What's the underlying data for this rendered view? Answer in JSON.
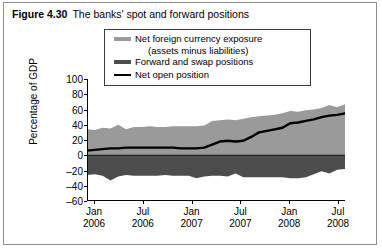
{
  "figure": {
    "number": "Figure 4.30",
    "caption": "The banks' spot and forward positions"
  },
  "colors": {
    "exposure_band": "#9a9a9a",
    "forward_swap": "#4d4d4d",
    "net_open_line": "#000000",
    "axis": "#000000",
    "frame": "#8d8d8d"
  },
  "chart_data": {
    "type": "area",
    "title": "The banks' spot and forward positions",
    "xlabel": "",
    "ylabel": "Percentage of GDP",
    "ylim": [
      -60,
      100
    ],
    "yticks": [
      100,
      80,
      60,
      40,
      20,
      0,
      -20,
      -40,
      -60
    ],
    "ytick_labels": [
      "100",
      "80",
      "60",
      "40",
      "20",
      "0",
      "–20",
      "–40",
      "–60"
    ],
    "grid": false,
    "legend_position": "top-center",
    "xtick_labels": [
      {
        "month": "Jan",
        "year": "2006"
      },
      {
        "month": "Jul",
        "year": "2006"
      },
      {
        "month": "Jan",
        "year": "2007"
      },
      {
        "month": "Jul",
        "year": "2007"
      },
      {
        "month": "Jan",
        "year": "2008"
      },
      {
        "month": "Jul",
        "year": "2008"
      }
    ],
    "x": [
      "2006-01",
      "2006-02",
      "2006-03",
      "2006-04",
      "2006-05",
      "2006-06",
      "2006-07",
      "2006-08",
      "2006-09",
      "2006-10",
      "2006-11",
      "2006-12",
      "2007-01",
      "2007-02",
      "2007-03",
      "2007-04",
      "2007-05",
      "2007-06",
      "2007-07",
      "2007-08",
      "2007-09",
      "2007-10",
      "2007-11",
      "2007-12",
      "2008-01",
      "2008-02",
      "2008-03",
      "2008-04",
      "2008-05",
      "2008-06",
      "2008-07",
      "2008-08",
      "2008-09",
      "2008-10"
    ],
    "series": [
      {
        "name": "Net foreign currency exposure (assets minus liabilities)",
        "role": "band-upper",
        "color": "#9a9a9a",
        "values": [
          34,
          33,
          36,
          35,
          40,
          34,
          37,
          37,
          38,
          37,
          37,
          38,
          38,
          38,
          38,
          39,
          45,
          46,
          47,
          46,
          48,
          50,
          51,
          52,
          53,
          55,
          58,
          57,
          59,
          60,
          62,
          66,
          63,
          67
        ]
      },
      {
        "name": "Forward and swap positions",
        "role": "band-lower",
        "color": "#4d4d4d",
        "values": [
          -26,
          -25,
          -27,
          -33,
          -28,
          -26,
          -27,
          -27,
          -27,
          -27,
          -26,
          -27,
          -27,
          -27,
          -30,
          -28,
          -27,
          -27,
          -28,
          -24,
          -29,
          -29,
          -29,
          -29,
          -29,
          -29,
          -30,
          -30,
          -29,
          -25,
          -21,
          -24,
          -19,
          -18
        ]
      },
      {
        "name": "Net open position",
        "role": "line",
        "color": "#000000",
        "values": [
          6,
          7,
          8,
          9,
          9,
          10,
          10,
          10,
          10,
          10,
          10,
          10,
          9,
          9,
          9,
          10,
          14,
          18,
          19,
          18,
          19,
          24,
          30,
          32,
          34,
          36,
          42,
          43,
          45,
          47,
          50,
          52,
          53,
          55
        ]
      }
    ]
  },
  "legend": {
    "items": [
      {
        "label": "Net foreign currency exposure",
        "sublabel": "(assets minus liabilities)",
        "swatch": "band-swatch"
      },
      {
        "label": "Forward and swap positions",
        "sublabel": "",
        "swatch": "forward-swatch"
      },
      {
        "label": "Net open position",
        "sublabel": "",
        "swatch": "line-swatch"
      }
    ]
  }
}
